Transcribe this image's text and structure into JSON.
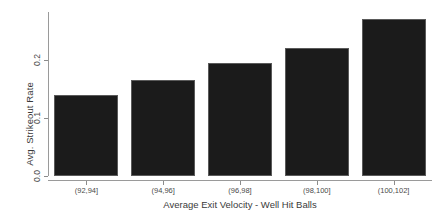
{
  "chart_data": {
    "type": "bar",
    "title": "",
    "xlabel": "Average Exit Velocity - Well Hit Balls",
    "ylabel": "Avg. Strikeout Rate",
    "categories": [
      "(92,94]",
      "(94,96]",
      "(96,98]",
      "(98,100]",
      "(100,102]"
    ],
    "values": [
      0.14,
      0.165,
      0.195,
      0.221,
      0.271
    ],
    "ylim": [
      0.0,
      0.283
    ],
    "yticks": [
      0.0,
      0.1,
      0.2
    ],
    "ytick_labels": [
      "0.0",
      "0.1",
      "0.2"
    ],
    "grid": false,
    "legend": null,
    "bar_color": "#1b1b1b",
    "bar_edge_color": "#5a5a5a",
    "axis_color": "#9a9a9a",
    "text_color": "#3a3a3a",
    "background": "#ffffff"
  }
}
